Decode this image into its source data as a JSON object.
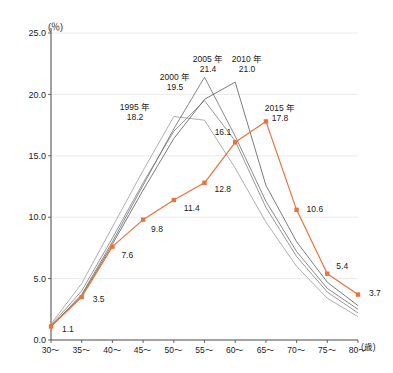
{
  "chart_data": {
    "type": "line",
    "title": "",
    "xlabel": "(歳)",
    "ylabel": "(％)",
    "ylim": [
      0.0,
      25.0
    ],
    "yticks": [
      "0.0",
      "5.0",
      "10.0",
      "15.0",
      "20.0",
      "25.0"
    ],
    "ytick_values": [
      0.0,
      5.0,
      10.0,
      15.0,
      20.0,
      25.0
    ],
    "grid": true,
    "legend_position": "inline-annotations",
    "categories": [
      "30～",
      "35～",
      "40～",
      "45～",
      "50～",
      "55～",
      "60～",
      "65～",
      "70～",
      "75～",
      "80～"
    ],
    "series": [
      {
        "name": "1995年",
        "color": "#9a9a9a",
        "peak_label": "1995 年",
        "peak_value": "18.2",
        "peak_category": "50～",
        "values": [
          1.3,
          4.6,
          9.2,
          13.8,
          18.2,
          17.9,
          14.0,
          9.6,
          6.0,
          3.4,
          1.9
        ]
      },
      {
        "name": "2000年",
        "color": "#7d7d7d",
        "peak_label": "2000 年",
        "peak_value": "19.5",
        "peak_category": "55～",
        "values": [
          1.2,
          4.0,
          8.3,
          12.8,
          17.0,
          19.5,
          16.2,
          10.8,
          6.8,
          3.9,
          2.2
        ]
      },
      {
        "name": "2005年",
        "color": "#6b6b6b",
        "peak_label": "2005 年",
        "peak_value": "21.4",
        "peak_category": "55～",
        "values": [
          1.1,
          3.7,
          8.0,
          12.6,
          17.2,
          21.4,
          16.6,
          11.3,
          7.2,
          4.2,
          2.5
        ]
      },
      {
        "name": "2010年",
        "color": "#5a5a5a",
        "peak_label": "2010 年",
        "peak_value": "21.0",
        "peak_category": "60～",
        "values": [
          1.1,
          3.6,
          7.8,
          12.2,
          16.4,
          19.6,
          21.0,
          12.6,
          8.0,
          4.7,
          2.8
        ]
      },
      {
        "name": "2015年",
        "color": "#e8733c",
        "peak_label": "2015 年",
        "peak_value": "17.8",
        "peak_category": "65～",
        "highlight": true,
        "values": [
          1.1,
          3.5,
          7.6,
          9.8,
          11.4,
          12.8,
          16.1,
          17.8,
          10.6,
          5.4,
          3.7
        ],
        "point_labels": [
          "1.1",
          "3.5",
          "7.6",
          "9.8",
          "11.4",
          "12.8",
          "16.1",
          "17.8",
          "10.6",
          "5.4",
          "3.7"
        ]
      }
    ]
  }
}
